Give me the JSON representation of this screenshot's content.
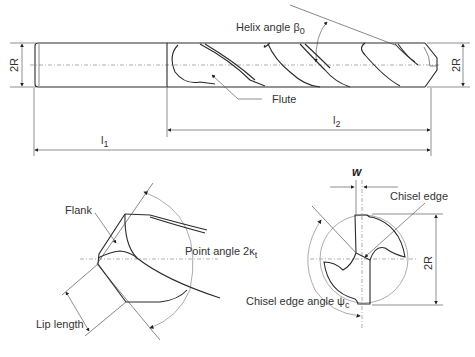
{
  "side_view": {
    "helix_label": "Helix angle β",
    "helix_sub": "0",
    "flute_label": "Flute",
    "shank_diameter_label": "2R",
    "tip_diameter_label": "2R",
    "overall_length_label": "l",
    "overall_length_sub": "1",
    "flute_length_label": "l",
    "flute_length_sub": "2"
  },
  "point_view": {
    "flank_label": "Flank",
    "point_angle_label": "Point angle 2κ",
    "point_angle_sub": "t",
    "lip_length_label": "Lip length"
  },
  "end_view": {
    "web_label": "w",
    "chisel_edge_label": "Chisel edge",
    "chisel_angle_label": "Chisel edge angle ψ",
    "chisel_angle_sub": "c",
    "diameter_label": "2R"
  }
}
